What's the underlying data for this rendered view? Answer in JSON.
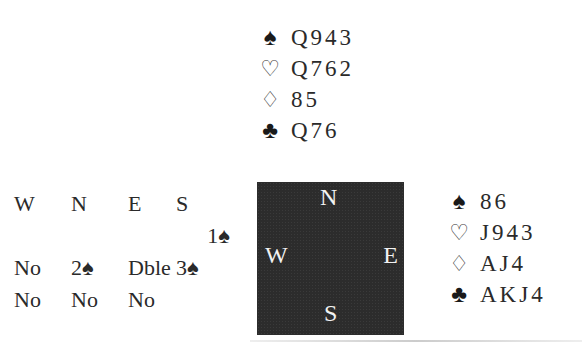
{
  "north": {
    "spades": "Q943",
    "hearts": "Q762",
    "diamonds": "85",
    "clubs": "Q76"
  },
  "east": {
    "spades": "86",
    "hearts": "J943",
    "diamonds": "AJ4",
    "clubs": "AKJ4"
  },
  "suits": {
    "spades": "♠",
    "hearts": "♡",
    "diamonds": "♢",
    "clubs": "♣"
  },
  "compass": {
    "n": "N",
    "w": "W",
    "e": "E",
    "s": "S"
  },
  "bidding": {
    "headers": [
      "W",
      "N",
      "E",
      "S"
    ],
    "rows": [
      [
        "",
        "",
        "",
        "1♠"
      ],
      [
        "No",
        "2♠",
        "Dble",
        "3♠"
      ],
      [
        "No",
        "No",
        "No",
        ""
      ]
    ]
  }
}
